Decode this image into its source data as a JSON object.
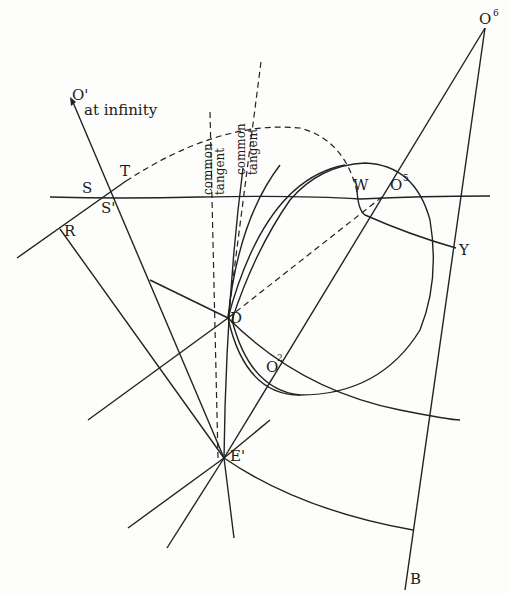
{
  "figure": {
    "type": "geometric-construction",
    "labels": {
      "o_prime": "O'",
      "at_infinity": "at infinity",
      "o6": "O",
      "o6_sup": "6",
      "t": "T",
      "s": "S",
      "s_prime": "S'",
      "r": "R",
      "w": "W",
      "o5": "O",
      "o5_sup": "5",
      "y": "Y",
      "d": "D",
      "o2": "O",
      "o2_sup": "2",
      "e_prime": "E'",
      "b": "B",
      "common_tangent_1": "common",
      "common_tangent_1b": "tangent",
      "common_tangent_2": "common",
      "common_tangent_2b": "tangent"
    },
    "colors": {
      "ink": "#222222",
      "paper": "#fdfdfb"
    }
  }
}
